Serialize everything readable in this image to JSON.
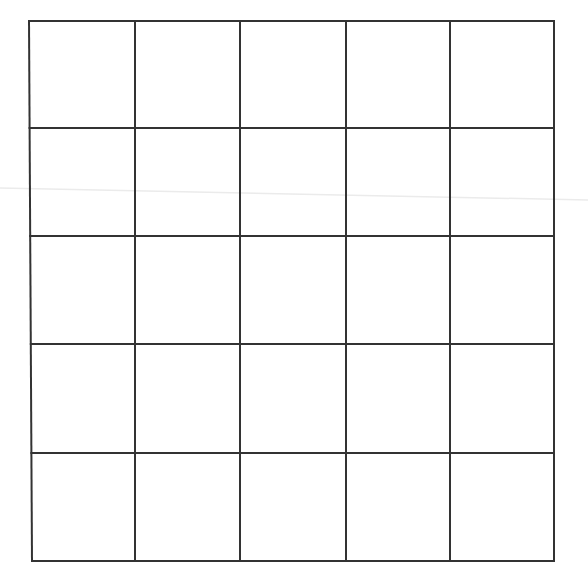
{
  "diagram": {
    "type": "grid",
    "rows": 5,
    "columns": 5,
    "cells_empty": true,
    "line_color": "#333333",
    "background_color": "#ffffff",
    "line_width": 2,
    "column_lines_x": [
      29,
      135,
      240,
      346,
      450,
      554
    ],
    "row_lines_y": [
      21,
      128,
      236,
      344,
      453,
      561
    ],
    "bottom_left_x": 32,
    "streak": {
      "x1": 0,
      "y1": 188,
      "x2": 588,
      "y2": 200,
      "color": "#ebebeb"
    }
  }
}
